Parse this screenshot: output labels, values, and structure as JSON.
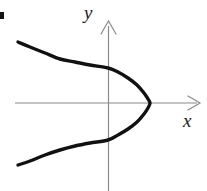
{
  "figure": {
    "background_color": "#ffffff",
    "width": 207,
    "height": 191,
    "axis_color": "#8a8a8a",
    "curve_color": "#111111",
    "curve_width": 3.4,
    "axis_width": 1.2,
    "corner_mark_label": ""
  },
  "labels": {
    "y_axis": "y",
    "x_axis": "x"
  },
  "chart_data": {
    "type": "line",
    "title": "",
    "subtitle": "",
    "xlabel": "x",
    "ylabel": "y",
    "grid": false,
    "legend": null,
    "axis_style": {
      "x_axis": {
        "orientation": "horizontal",
        "pixel_y": 103,
        "pixel_x_start": 15,
        "pixel_x_end": 200,
        "arrow": "right",
        "ticks": [],
        "tick_labels": []
      },
      "y_axis": {
        "orientation": "vertical",
        "pixel_x": 108,
        "pixel_y_start": 22,
        "pixel_y_end": 191,
        "arrow": "up",
        "ticks": [],
        "tick_labels": []
      },
      "origin_pixel": [
        108,
        103
      ]
    },
    "series": [
      {
        "name": "parabola",
        "description": "Sideways parabola opening to the left, vertex on the positive x-axis",
        "equation": "x = a - b*y^2  (opens left)",
        "vertex": [
          150,
          103
        ],
        "orientation": "opens-left",
        "y_axis_intercepts_pixel": [
          [
            108,
            68
          ],
          [
            108,
            140
          ]
        ],
        "endpoints_pixel": [
          [
            18,
            42
          ],
          [
            18,
            165
          ]
        ],
        "points_pixel": [
          [
            18,
            42
          ],
          [
            30,
            47
          ],
          [
            45,
            53
          ],
          [
            60,
            59
          ],
          [
            75,
            62
          ],
          [
            90,
            65
          ],
          [
            108,
            68
          ],
          [
            118,
            72
          ],
          [
            128,
            78
          ],
          [
            137,
            85
          ],
          [
            144,
            93
          ],
          [
            148,
            99
          ],
          [
            150,
            103
          ],
          [
            148,
            108
          ],
          [
            144,
            114
          ],
          [
            137,
            122
          ],
          [
            128,
            129
          ],
          [
            118,
            135
          ],
          [
            108,
            140
          ],
          [
            90,
            143
          ],
          [
            75,
            146
          ],
          [
            60,
            150
          ],
          [
            45,
            155
          ],
          [
            30,
            161
          ],
          [
            18,
            165
          ]
        ]
      }
    ],
    "annotations": []
  }
}
